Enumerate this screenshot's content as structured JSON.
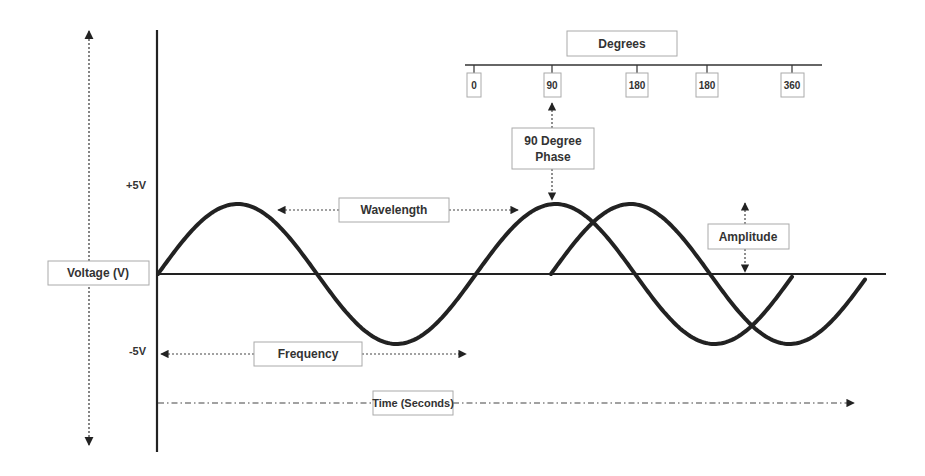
{
  "colors": {
    "wave": "#222222",
    "axis": "#333333",
    "label_text": "#333333",
    "label_border": "#b0b0b0",
    "background": "#ffffff"
  },
  "degrees": {
    "title": "Degrees",
    "ticks": [
      "0",
      "90",
      "180",
      "180",
      "360"
    ]
  },
  "labels": {
    "phase_line1": "90 Degree",
    "phase_line2": "Phase",
    "voltage_axis": "Voltage (V)",
    "plus_5v": "+5V",
    "minus_5v": "-5V",
    "wavelength": "Wavelength",
    "amplitude": "Amplitude",
    "frequency": "Frequency",
    "time_axis": "Time (Seconds)"
  },
  "waves": [
    {
      "name": "reference-wave",
      "start_x": 158,
      "end_x": 793
    },
    {
      "name": "phase-shifted-wave",
      "start_x": 551,
      "end_x": 865
    }
  ]
}
